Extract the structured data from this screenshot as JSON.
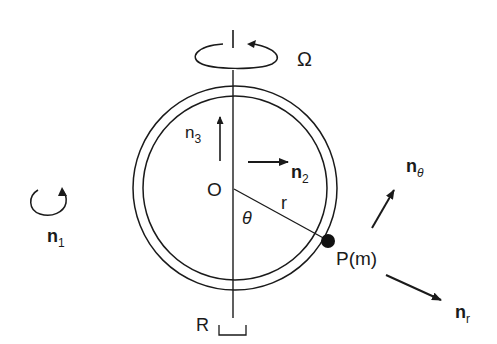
{
  "diagram": {
    "title": "",
    "labels": {
      "omega": "Ω",
      "origin": "O",
      "radius": "r",
      "theta": "θ",
      "point": "P(m)",
      "support": "R",
      "n1": {
        "base": "n",
        "sub": "1"
      },
      "n2": {
        "base": "n",
        "sub": "2"
      },
      "n3": {
        "base": "n",
        "sub": "3"
      },
      "n_theta": {
        "base": "n",
        "sub": "θ"
      },
      "n_r": {
        "base": "n",
        "sub": "r"
      }
    },
    "elements": [
      {
        "id": "hoop",
        "type": "double-circle",
        "description": "circular tube rotating about vertical axis"
      },
      {
        "id": "axis",
        "type": "vertical-line",
        "description": "rotation axis through O"
      },
      {
        "id": "omega-rotation",
        "type": "curved-arrow",
        "label": "Ω"
      },
      {
        "id": "n1-rotation",
        "type": "curved-arrow",
        "label": "n1"
      },
      {
        "id": "bead",
        "type": "point-mass",
        "label": "P(m)"
      },
      {
        "id": "n2-arrow",
        "type": "arrow",
        "direction": "right"
      },
      {
        "id": "n3-arrow",
        "type": "arrow",
        "direction": "up"
      },
      {
        "id": "n-theta-arrow",
        "type": "arrow",
        "direction": "up-right"
      },
      {
        "id": "n-r-arrow",
        "type": "arrow",
        "direction": "down-right"
      },
      {
        "id": "support-bracket",
        "type": "bracket",
        "label": "R"
      }
    ],
    "colors": {
      "ink": "#1a1a1a",
      "background": "#ffffff"
    }
  }
}
